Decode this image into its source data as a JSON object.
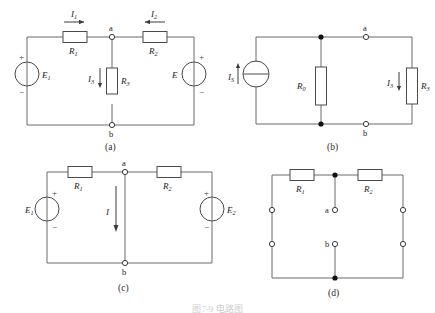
{
  "figure": {
    "caption": "图7-9  电路图",
    "panels": [
      {
        "id": "a",
        "label": "(a)",
        "nodes": [
          {
            "name": "a",
            "label": "a",
            "type": "open"
          },
          {
            "name": "b",
            "label": "b",
            "type": "open"
          }
        ],
        "resistors": [
          {
            "name": "R1",
            "label": "R",
            "sub": "1",
            "orientation": "horizontal"
          },
          {
            "name": "R2",
            "label": "R",
            "sub": "2",
            "orientation": "horizontal"
          },
          {
            "name": "R3",
            "label": "R",
            "sub": "3",
            "orientation": "vertical"
          }
        ],
        "sources": [
          {
            "name": "E1",
            "label": "E",
            "sub": "1",
            "type": "voltage",
            "plus": "+",
            "minus": "−"
          },
          {
            "name": "E",
            "label": "E",
            "sub": "",
            "type": "voltage",
            "plus": "+",
            "minus": "−"
          }
        ],
        "currents": [
          {
            "name": "I1",
            "label": "I",
            "sub": "1",
            "direction": "right"
          },
          {
            "name": "I2",
            "label": "I",
            "sub": "2",
            "direction": "left"
          },
          {
            "name": "I3",
            "label": "I",
            "sub": "3",
            "direction": "down"
          }
        ]
      },
      {
        "id": "b",
        "label": "(b)",
        "nodes": [
          {
            "name": "a",
            "label": "a",
            "type": "open"
          },
          {
            "name": "b",
            "label": "b",
            "type": "open"
          }
        ],
        "resistors": [
          {
            "name": "R0",
            "label": "R",
            "sub": "0",
            "orientation": "vertical"
          },
          {
            "name": "R3",
            "label": "R",
            "sub": "3",
            "orientation": "vertical"
          }
        ],
        "sources": [
          {
            "name": "IS",
            "label": "I",
            "sub": "S",
            "type": "current",
            "direction": "up"
          }
        ],
        "currents": [
          {
            "name": "I3",
            "label": "I",
            "sub": "3",
            "direction": "down"
          }
        ]
      },
      {
        "id": "c",
        "label": "(c)",
        "nodes": [
          {
            "name": "a",
            "label": "a",
            "type": "open"
          },
          {
            "name": "b",
            "label": "b",
            "type": "open"
          }
        ],
        "resistors": [
          {
            "name": "R1",
            "label": "R",
            "sub": "1",
            "orientation": "horizontal"
          },
          {
            "name": "R2",
            "label": "R",
            "sub": "2",
            "orientation": "horizontal"
          }
        ],
        "sources": [
          {
            "name": "E1",
            "label": "E",
            "sub": "1",
            "type": "voltage",
            "plus": "+",
            "minus": "−"
          },
          {
            "name": "E2",
            "label": "E",
            "sub": "2",
            "type": "voltage",
            "plus": "+",
            "minus": "−"
          }
        ],
        "currents": [
          {
            "name": "I",
            "label": "I",
            "sub": "",
            "direction": "down"
          }
        ]
      },
      {
        "id": "d",
        "label": "(d)",
        "nodes": [
          {
            "name": "a",
            "label": "a",
            "type": "open"
          },
          {
            "name": "b",
            "label": "b",
            "type": "open"
          }
        ],
        "resistors": [
          {
            "name": "R1",
            "label": "R",
            "sub": "1",
            "orientation": "horizontal"
          },
          {
            "name": "R2",
            "label": "R",
            "sub": "2",
            "orientation": "horizontal"
          }
        ],
        "sources": [],
        "currents": []
      }
    ]
  },
  "colors": {
    "wire": "#6b6b6b",
    "component_stroke": "#4a4a4a",
    "text": "#1c1c1c",
    "background": "#ffffff",
    "node_fill": "#ffffff",
    "junction_fill": "#111111"
  }
}
